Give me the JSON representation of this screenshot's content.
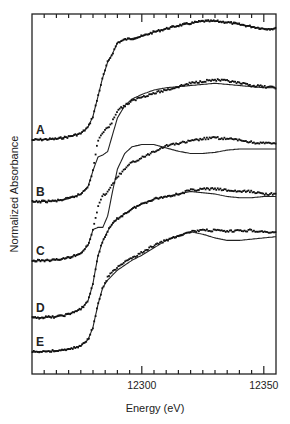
{
  "chart_data": {
    "type": "line",
    "title": "",
    "xlabel": "Energy (eV)",
    "ylabel": "Normalized Absorbance",
    "xlim": [
      12255,
      12355
    ],
    "x_major_ticks": [
      12300,
      12350
    ],
    "x_minor_step": 5,
    "grid": false,
    "legend": "none (curves labeled A–E at left)",
    "series": [
      {
        "name": "A",
        "offset_px": 140,
        "scale_px": 108,
        "data_x": [
          12255,
          12265,
          12270,
          12275,
          12278,
          12280,
          12282,
          12284,
          12286,
          12288,
          12290,
          12293,
          12296,
          12300,
          12305,
          12310,
          12315,
          12320,
          12325,
          12330,
          12335,
          12340,
          12345,
          12350,
          12355
        ],
        "data_y": [
          0.0,
          0.01,
          0.03,
          0.06,
          0.12,
          0.22,
          0.4,
          0.58,
          0.72,
          0.8,
          0.9,
          0.93,
          0.94,
          0.96,
          1.0,
          1.03,
          1.06,
          1.08,
          1.1,
          1.1,
          1.09,
          1.07,
          1.05,
          1.03,
          1.03
        ],
        "fit_y": [
          0.0,
          0.01,
          0.03,
          0.06,
          0.12,
          0.22,
          0.4,
          0.58,
          0.72,
          0.8,
          0.9,
          0.93,
          0.94,
          0.96,
          1.0,
          1.03,
          1.06,
          1.08,
          1.1,
          1.1,
          1.09,
          1.07,
          1.05,
          1.03,
          1.03
        ]
      },
      {
        "name": "B",
        "offset_px": 202,
        "scale_px": 112,
        "data_x": [
          12255,
          12265,
          12270,
          12275,
          12278,
          12280,
          12282,
          12284,
          12286,
          12288,
          12290,
          12293,
          12296,
          12300,
          12305,
          12310,
          12315,
          12320,
          12325,
          12330,
          12335,
          12340,
          12345,
          12350,
          12355
        ],
        "data_y": [
          0.0,
          0.01,
          0.03,
          0.07,
          0.14,
          0.28,
          0.55,
          0.62,
          0.66,
          0.72,
          0.82,
          0.86,
          0.9,
          0.94,
          0.97,
          1.0,
          1.03,
          1.06,
          1.08,
          1.09,
          1.08,
          1.06,
          1.04,
          1.03,
          1.02
        ],
        "fit_y": [
          0.0,
          0.01,
          0.03,
          0.07,
          0.14,
          0.28,
          0.4,
          0.42,
          0.45,
          0.6,
          0.75,
          0.86,
          0.92,
          0.96,
          1.0,
          1.02,
          1.03,
          1.04,
          1.05,
          1.06,
          1.05,
          1.04,
          1.03,
          1.02,
          1.02
        ]
      },
      {
        "name": "C",
        "offset_px": 261,
        "scale_px": 112,
        "data_x": [
          12255,
          12265,
          12270,
          12275,
          12278,
          12280,
          12282,
          12284,
          12286,
          12288,
          12290,
          12293,
          12296,
          12300,
          12305,
          12310,
          12315,
          12320,
          12325,
          12330,
          12335,
          12340,
          12345,
          12350,
          12355
        ],
        "data_y": [
          0.0,
          0.01,
          0.03,
          0.07,
          0.14,
          0.28,
          0.48,
          0.58,
          0.62,
          0.68,
          0.75,
          0.82,
          0.88,
          0.92,
          0.98,
          1.03,
          1.05,
          1.07,
          1.09,
          1.1,
          1.09,
          1.08,
          1.06,
          1.05,
          1.05
        ],
        "fit_y": [
          0.0,
          0.01,
          0.03,
          0.07,
          0.14,
          0.28,
          0.3,
          0.3,
          0.4,
          0.62,
          0.82,
          0.96,
          1.02,
          1.04,
          1.04,
          1.01,
          0.98,
          0.96,
          0.96,
          0.97,
          0.99,
          1.0,
          1.0,
          1.0,
          1.0
        ]
      },
      {
        "name": "D",
        "offset_px": 318,
        "scale_px": 124,
        "data_x": [
          12255,
          12265,
          12270,
          12275,
          12278,
          12280,
          12282,
          12284,
          12286,
          12288,
          12290,
          12293,
          12296,
          12300,
          12305,
          12310,
          12315,
          12320,
          12325,
          12330,
          12335,
          12340,
          12345,
          12350,
          12355
        ],
        "data_y": [
          0.0,
          0.01,
          0.03,
          0.07,
          0.14,
          0.28,
          0.5,
          0.62,
          0.7,
          0.76,
          0.8,
          0.84,
          0.88,
          0.92,
          0.96,
          0.98,
          1.0,
          1.03,
          1.04,
          1.04,
          1.03,
          1.02,
          1.02,
          1.0,
          1.0
        ],
        "fit_y": [
          0.0,
          0.01,
          0.03,
          0.07,
          0.14,
          0.28,
          0.5,
          0.62,
          0.7,
          0.76,
          0.8,
          0.84,
          0.88,
          0.92,
          0.96,
          0.98,
          1.0,
          1.02,
          1.01,
          1.0,
          0.98,
          0.97,
          0.97,
          0.98,
          0.98
        ]
      },
      {
        "name": "E",
        "offset_px": 352,
        "scale_px": 124,
        "data_x": [
          12255,
          12265,
          12270,
          12275,
          12278,
          12280,
          12282,
          12284,
          12286,
          12288,
          12290,
          12293,
          12296,
          12300,
          12305,
          12310,
          12315,
          12320,
          12325,
          12330,
          12335,
          12340,
          12345,
          12350,
          12355
        ],
        "data_y": [
          0.0,
          0.01,
          0.02,
          0.05,
          0.1,
          0.2,
          0.38,
          0.52,
          0.6,
          0.65,
          0.68,
          0.72,
          0.76,
          0.8,
          0.86,
          0.9,
          0.94,
          0.97,
          0.98,
          0.98,
          0.97,
          0.98,
          0.98,
          0.97,
          0.96
        ],
        "fit_y": [
          0.0,
          0.01,
          0.02,
          0.05,
          0.1,
          0.2,
          0.38,
          0.52,
          0.58,
          0.62,
          0.66,
          0.7,
          0.74,
          0.78,
          0.84,
          0.9,
          0.94,
          0.97,
          0.95,
          0.92,
          0.9,
          0.9,
          0.91,
          0.92,
          0.93
        ]
      }
    ]
  },
  "axis": {
    "x_label": "Energy (eV)",
    "y_label": "Normalized Absorbance",
    "tick_labels": [
      "12300",
      "12350"
    ]
  },
  "series_labels": [
    "A",
    "B",
    "C",
    "D",
    "E"
  ]
}
